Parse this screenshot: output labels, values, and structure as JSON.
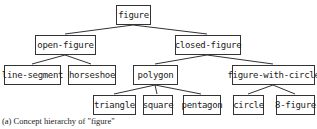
{
  "diagram": {
    "type": "tree",
    "nodes": {
      "figure": "figure",
      "open_figure": "open-figure",
      "closed_figure": "closed-figure",
      "line_segment": "line-segment",
      "horseshoe": "horseshoe",
      "polygon": "polygon",
      "figure_with_circle": "figure-with-circle",
      "triangle": "triangle",
      "square": "square",
      "pentagon": "pentagon",
      "circle": "circle",
      "eight_figure": "8-figure"
    },
    "edges": [
      [
        "figure",
        "open-figure"
      ],
      [
        "figure",
        "closed-figure"
      ],
      [
        "open-figure",
        "line-segment"
      ],
      [
        "open-figure",
        "horseshoe"
      ],
      [
        "closed-figure",
        "polygon"
      ],
      [
        "closed-figure",
        "figure-with-circle"
      ],
      [
        "polygon",
        "triangle"
      ],
      [
        "polygon",
        "square"
      ],
      [
        "polygon",
        "pentagon"
      ],
      [
        "figure-with-circle",
        "circle"
      ],
      [
        "figure-with-circle",
        "8-figure"
      ]
    ],
    "caption": "(a) Concept hierarchy of \"figure\""
  }
}
